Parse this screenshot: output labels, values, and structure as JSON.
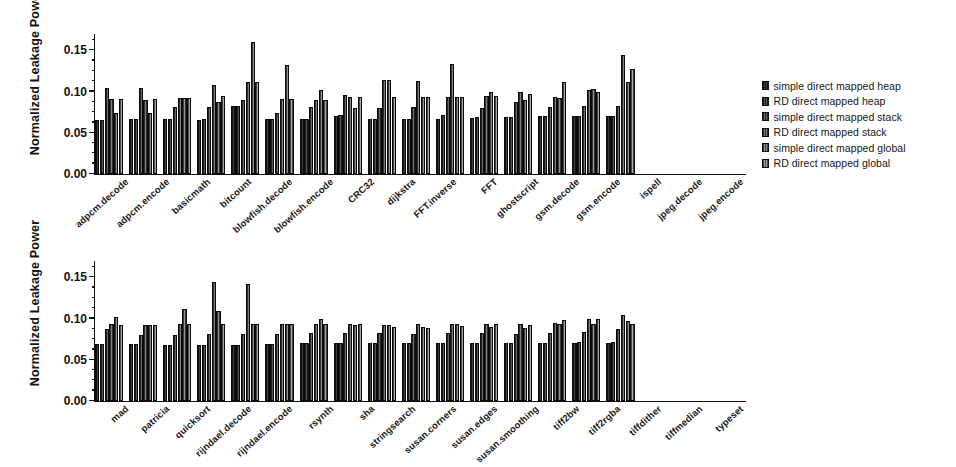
{
  "figure": {
    "background": "#ffffff",
    "ink": "#141414"
  },
  "legend": {
    "position": "right",
    "items": [
      {
        "label": "simple direct mapped heap",
        "style": "s0"
      },
      {
        "label": "RD direct mapped heap",
        "style": "s1"
      },
      {
        "label": "simple direct mapped stack",
        "style": "s2"
      },
      {
        "label": "RD direct mapped stack",
        "style": "s3"
      },
      {
        "label": "simple direct mapped global",
        "style": "s4"
      },
      {
        "label": "RD direct mapped global",
        "style": "s5"
      }
    ]
  },
  "axis": {
    "ylabel": "Normalized Leakage Power",
    "yticks": [
      "0.00",
      "0.05",
      "0.10",
      "0.15"
    ],
    "ytick_values": [
      0.0,
      0.05,
      0.1,
      0.15
    ],
    "ymin": 0.0,
    "ymax": 0.17,
    "minor_tick_step": 0.0125
  },
  "chart_data": [
    {
      "type": "bar",
      "panel": "top",
      "title": "",
      "xlabel": "",
      "ylabel": "Normalized Leakage Power",
      "ylim": [
        0.0,
        0.17
      ],
      "yticks": [
        0.0,
        0.05,
        0.1,
        0.15
      ],
      "grid": false,
      "legend_position": "right",
      "categories": [
        "adpcm.decode",
        "adpcm.encode",
        "basicmath",
        "bitcount",
        "blowfish.decode",
        "blowfish.encode",
        "CRC32",
        "dijkstra",
        "FFT.inverse",
        "FFT",
        "ghostscript",
        "gsm.decode",
        "gsm.encode",
        "ispell",
        "jpeg.decode",
        "jpeg.encode"
      ],
      "series": [
        {
          "name": "simple direct mapped heap",
          "values": [
            0.065,
            0.067,
            0.067,
            0.065,
            0.082,
            0.067,
            0.067,
            0.071,
            0.067,
            0.067,
            0.067,
            0.068,
            0.069,
            0.07,
            0.07,
            0.07
          ]
        },
        {
          "name": "RD direct mapped heap",
          "values": [
            0.066,
            0.067,
            0.067,
            0.067,
            0.082,
            0.067,
            0.067,
            0.072,
            0.067,
            0.067,
            0.072,
            0.069,
            0.069,
            0.07,
            0.07,
            0.07
          ]
        },
        {
          "name": "simple direct mapped stack",
          "values": [
            0.105,
            0.104,
            0.081,
            0.081,
            0.09,
            0.074,
            0.081,
            0.096,
            0.08,
            0.081,
            0.093,
            0.08,
            0.087,
            0.081,
            0.082,
            0.082
          ]
        },
        {
          "name": "RD direct mapped stack",
          "values": [
            0.091,
            0.09,
            0.092,
            0.108,
            0.112,
            0.091,
            0.09,
            0.094,
            0.114,
            0.113,
            0.134,
            0.095,
            0.099,
            0.093,
            0.102,
            0.145
          ]
        },
        {
          "name": "simple direct mapped global",
          "values": [
            0.074,
            0.074,
            0.092,
            0.087,
            0.16,
            0.132,
            0.102,
            0.08,
            0.114,
            0.094,
            0.093,
            0.099,
            0.09,
            0.092,
            0.103,
            0.112
          ]
        },
        {
          "name": "RD direct mapped global",
          "values": [
            0.091,
            0.091,
            0.092,
            0.095,
            0.112,
            0.091,
            0.09,
            0.093,
            0.093,
            0.093,
            0.094,
            0.095,
            0.097,
            0.112,
            0.1,
            0.128
          ]
        }
      ]
    },
    {
      "type": "bar",
      "panel": "bottom",
      "title": "",
      "xlabel": "",
      "ylabel": "Normalized Leakage Power",
      "ylim": [
        0.0,
        0.17
      ],
      "yticks": [
        0.0,
        0.05,
        0.1,
        0.15
      ],
      "grid": false,
      "legend_position": "none",
      "categories": [
        "mad",
        "patricia",
        "quicksort",
        "rijndael.decode",
        "rijndael.encode",
        "rsynth",
        "sha",
        "stringsearch",
        "susan.corners",
        "susan.edges",
        "susan.smoothing",
        "tiff2bw",
        "tiff2rgba",
        "tiffdither",
        "tiffmedian",
        "typeset"
      ],
      "series": [
        {
          "name": "simple direct mapped heap",
          "values": [
            0.069,
            0.069,
            0.068,
            0.068,
            0.068,
            0.069,
            0.07,
            0.07,
            0.07,
            0.07,
            0.07,
            0.07,
            0.071,
            0.071,
            0.071,
            0.071
          ]
        },
        {
          "name": "RD direct mapped heap",
          "values": [
            0.069,
            0.069,
            0.068,
            0.068,
            0.068,
            0.069,
            0.07,
            0.07,
            0.07,
            0.07,
            0.07,
            0.071,
            0.071,
            0.071,
            0.072,
            0.072
          ]
        },
        {
          "name": "simple direct mapped stack",
          "values": [
            0.088,
            0.08,
            0.08,
            0.081,
            0.081,
            0.081,
            0.082,
            0.082,
            0.083,
            0.081,
            0.082,
            0.082,
            0.081,
            0.082,
            0.084,
            0.088
          ]
        },
        {
          "name": "RD direct mapped stack",
          "values": [
            0.094,
            0.092,
            0.093,
            0.144,
            0.142,
            0.093,
            0.094,
            0.093,
            0.092,
            0.093,
            0.094,
            0.094,
            0.094,
            0.095,
            0.099,
            0.105
          ]
        },
        {
          "name": "simple direct mapped global",
          "values": [
            0.102,
            0.092,
            0.112,
            0.109,
            0.094,
            0.094,
            0.099,
            0.092,
            0.092,
            0.09,
            0.094,
            0.09,
            0.089,
            0.094,
            0.093,
            0.097
          ]
        },
        {
          "name": "RD direct mapped global",
          "values": [
            0.092,
            0.092,
            0.094,
            0.094,
            0.094,
            0.094,
            0.094,
            0.094,
            0.09,
            0.089,
            0.091,
            0.093,
            0.092,
            0.098,
            0.099,
            0.094
          ]
        }
      ]
    }
  ]
}
